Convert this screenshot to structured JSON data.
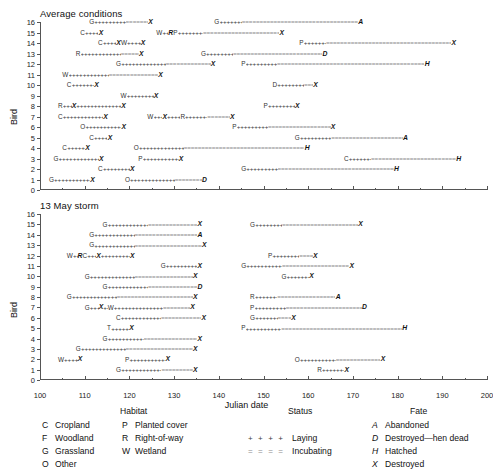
{
  "figure": {
    "xaxis_name": "Julian date",
    "yaxis_name": "Bird"
  },
  "chart_data": {
    "type": "table",
    "xlabel": "Julian date",
    "ylabel": "Bird",
    "xlim": [
      100,
      200
    ],
    "ylim": [
      0,
      16
    ],
    "xticks": [
      100,
      110,
      120,
      130,
      140,
      150,
      160,
      170,
      180,
      190,
      200
    ],
    "xminor_step": 5,
    "yticks": [
      0,
      1,
      2,
      3,
      4,
      5,
      6,
      7,
      8,
      9,
      10,
      11,
      12,
      13,
      14,
      15,
      16
    ],
    "grid": false,
    "legend_position": "below-axes",
    "panels": [
      {
        "title": "Average conditions",
        "records": [
          {
            "bird": 16,
            "habitat": "G",
            "start": 111,
            "lay_end": 118,
            "incub_end": 123,
            "fate": "X"
          },
          {
            "bird": 16,
            "habitat": "G",
            "start": 139,
            "lay_end": 144,
            "incub_end": 170,
            "fate": "A"
          },
          {
            "bird": 15,
            "habitat": "C",
            "start": 109,
            "lay_end": 112,
            "fate": "X"
          },
          {
            "bird": 15,
            "habitat": "W",
            "start": 126,
            "mid": [
              {
                "code": "R",
                "pos": 127.3,
                "type": "fate"
              }
            ],
            "habitat2": "P",
            "start2": 128.3,
            "lay_end": 134,
            "incub_end": 151,
            "fate": "X"
          },
          {
            "bird": 14,
            "habitat": "C",
            "start": 113,
            "lay_end": 115,
            "mid": [
              {
                "code": "X",
                "pos": 116,
                "type": "fate"
              }
            ],
            "habitat2": "W",
            "start2": 117,
            "lay_end2": 120,
            "fate": "X"
          },
          {
            "bird": 14,
            "habitat": "P",
            "start": 158,
            "lay_end": 163,
            "incub_end": 191,
            "fate": "X"
          },
          {
            "bird": 13,
            "habitat": "R",
            "start": 108,
            "lay_end": 117,
            "incub_end": 121,
            "fate": "X"
          },
          {
            "bird": 13,
            "habitat": "G",
            "start": 136,
            "lay_end": 142,
            "incub_end": 162,
            "fate": "D"
          },
          {
            "bird": 12,
            "habitat": "G",
            "start": 117,
            "lay_end": 127,
            "incub_end": 137,
            "fate": "X"
          },
          {
            "bird": 12,
            "habitat": "P",
            "start": 145,
            "lay_end": 152,
            "incub_end": 185,
            "fate": "H"
          },
          {
            "bird": 11,
            "habitat": "W",
            "start": 105,
            "lay_end": 114,
            "incub_end": 125,
            "fate": "X"
          },
          {
            "bird": 10,
            "habitat": "C",
            "start": 106,
            "lay_end": 111,
            "fate": "X"
          },
          {
            "bird": 10,
            "habitat": "D",
            "start": 152,
            "lay_end": 158,
            "incub_end": 160,
            "fate": "X"
          },
          {
            "bird": 9,
            "habitat": "W",
            "start": 118,
            "lay_end": 124,
            "fate": "X"
          },
          {
            "bird": 8,
            "habitat": "R",
            "start": 104,
            "mid": [
              {
                "code": "X",
                "pos": 106,
                "type": "fate"
              }
            ],
            "start2": 107,
            "lay_end": 116,
            "fate": "X"
          },
          {
            "bird": 8,
            "habitat": "P",
            "start": 150,
            "lay_end": 156,
            "fate": "X"
          },
          {
            "bird": 7,
            "habitat": "C",
            "start": 104,
            "lay_end": 113,
            "fate": "X"
          },
          {
            "bird": 7,
            "habitat": "W",
            "start": 124,
            "mid": [
              {
                "code": "X",
                "pos": 126,
                "type": "fate"
              },
              {
                "code": "R",
                "pos": 129,
                "type": "hab"
              }
            ],
            "lay_end": 134,
            "incub_end": 139,
            "fate": "X"
          },
          {
            "bird": 6,
            "habitat": "O",
            "start": 109,
            "lay_end": 117,
            "fate": "X"
          },
          {
            "bird": 6,
            "habitat": "P",
            "start": 143,
            "lay_end": 150,
            "incub_end": 164,
            "fate": "X"
          },
          {
            "bird": 5,
            "habitat": "C",
            "start": 111,
            "lay_end": 114,
            "fate": "X"
          },
          {
            "bird": 5,
            "habitat": "G",
            "start": 157,
            "lay_end": 164,
            "incub_end": 180,
            "fate": "A"
          },
          {
            "bird": 4,
            "habitat": "C",
            "start": 105,
            "lay_end": 109,
            "fate": "X"
          },
          {
            "bird": 4,
            "habitat": "O",
            "start": 121,
            "lay_end": 131,
            "incub_end": 158,
            "fate": "H"
          },
          {
            "bird": 3,
            "habitat": "G",
            "start": 103,
            "lay_end": 112,
            "fate": "X"
          },
          {
            "bird": 3,
            "habitat": "P",
            "start": 122,
            "lay_end": 130,
            "fate": "X"
          },
          {
            "bird": 3,
            "habitat": "C",
            "start": 168,
            "lay_end": 173,
            "incub_end": 192,
            "fate": "H"
          },
          {
            "bird": 2,
            "habitat": "C",
            "start": 113,
            "lay_end": 119,
            "fate": "X"
          },
          {
            "bird": 2,
            "habitat": "G",
            "start": 145,
            "lay_end": 152,
            "incub_end": 178,
            "fate": "H"
          },
          {
            "bird": 1,
            "habitat": "G",
            "start": 102,
            "lay_end": 110,
            "fate": "X"
          },
          {
            "bird": 1,
            "habitat": "O",
            "start": 119,
            "lay_end": 129,
            "incub_end": 135,
            "fate": "D"
          }
        ]
      },
      {
        "title": "13 May storm",
        "records": [
          {
            "bird": 15,
            "habitat": "G",
            "start": 114,
            "lay_end": 123,
            "incub_end": 134,
            "fate": "X"
          },
          {
            "bird": 15,
            "habitat": "G",
            "start": 147,
            "lay_end": 153,
            "incub_end": 170,
            "fate": "X"
          },
          {
            "bird": 14,
            "habitat": "G",
            "start": 111,
            "lay_end": 120,
            "incub_end": 134,
            "fate": "A"
          },
          {
            "bird": 13,
            "habitat": "G",
            "start": 111,
            "lay_end": 120,
            "incub_end": 135,
            "fate": "X"
          },
          {
            "bird": 12,
            "habitat": "W",
            "start": 106,
            "mid": [
              {
                "code": "R",
                "pos": 107,
                "type": "fate"
              }
            ],
            "habitat2": "C",
            "start2": 108,
            "lay_end": 110,
            "mid2": [
              {
                "code": "X",
                "pos": 111.5,
                "type": "fate"
              }
            ],
            "lay_end2": 118,
            "fate": "X"
          },
          {
            "bird": 12,
            "habitat": "P",
            "start": 151,
            "lay_end": 157,
            "incub_end": 160,
            "fate": "X"
          },
          {
            "bird": 11,
            "habitat": "G",
            "start": 127,
            "lay_end": 134,
            "fate": "X"
          },
          {
            "bird": 11,
            "habitat": "G",
            "start": 145,
            "lay_end": 153,
            "incub_end": 168,
            "fate": "X"
          },
          {
            "bird": 10,
            "habitat": "G",
            "start": 110,
            "lay_end": 120,
            "incub_end": 133,
            "fate": "X"
          },
          {
            "bird": 10,
            "habitat": "G",
            "start": 154,
            "lay_end": 159,
            "fate": "X"
          },
          {
            "bird": 9,
            "habitat": "G",
            "start": 114,
            "lay_end": 123,
            "incub_end": 134,
            "fate": "D"
          },
          {
            "bird": 8,
            "habitat": "G",
            "start": 106,
            "lay_end": 116,
            "incub_end": 133,
            "fate": "X"
          },
          {
            "bird": 8,
            "habitat": "R",
            "start": 147,
            "lay_end": 152,
            "incub_end": 165,
            "fate": "A"
          },
          {
            "bird": 7,
            "habitat": "G",
            "start": 110,
            "mid": [
              {
                "code": "X",
                "pos": 112,
                "type": "fate"
              },
              {
                "code": "W",
                "pos": 113,
                "type": "hab"
              }
            ],
            "lay_end": 124,
            "incub_end": 130,
            "fate": "X"
          },
          {
            "bird": 7,
            "habitat": "P",
            "start": 147,
            "lay_end": 154,
            "incub_end": 171,
            "fate": "D"
          },
          {
            "bird": 6,
            "habitat": "C",
            "start": 117,
            "lay_end": 126,
            "incub_end": 135,
            "fate": "X"
          },
          {
            "bird": 6,
            "habitat": "G",
            "start": 147,
            "lay_end": 152,
            "incub_end": 155,
            "fate": "X"
          },
          {
            "bird": 5,
            "habitat": "T",
            "start": 115,
            "lay_end": 119,
            "fate": "X"
          },
          {
            "bird": 5,
            "habitat": "P",
            "start": 145,
            "lay_end": 153,
            "incub_end": 180,
            "fate": "H"
          },
          {
            "bird": 4,
            "habitat": "G",
            "start": 114,
            "lay_end": 122,
            "incub_end": 134,
            "fate": "X"
          },
          {
            "bird": 3,
            "habitat": "G",
            "start": 108,
            "lay_end": 118,
            "incub_end": 133,
            "fate": "X"
          },
          {
            "bird": 2,
            "habitat": "W",
            "start": 104,
            "lay_end": 107,
            "fate": "X"
          },
          {
            "bird": 2,
            "habitat": "P",
            "start": 119,
            "lay_end": 127,
            "fate": "X"
          },
          {
            "bird": 2,
            "habitat": "O",
            "start": 157,
            "lay_end": 165,
            "incub_end": 175,
            "fate": "X"
          },
          {
            "bird": 1,
            "habitat": "G",
            "start": 117,
            "lay_end": 126,
            "incub_end": 133,
            "fate": "X"
          },
          {
            "bird": 1,
            "habitat": "R",
            "start": 162,
            "lay_end": 167,
            "fate": "X"
          }
        ]
      }
    ]
  },
  "legend": {
    "habitat": {
      "heading": "Habitat",
      "col1": [
        {
          "code": "C",
          "label": "Cropland"
        },
        {
          "code": "F",
          "label": "Woodland"
        },
        {
          "code": "G",
          "label": "Grassland"
        },
        {
          "code": "O",
          "label": "Other"
        }
      ],
      "col2": [
        {
          "code": "P",
          "label": "Planted cover"
        },
        {
          "code": "R",
          "label": "Right-of-way"
        },
        {
          "code": "W",
          "label": "Wetland"
        }
      ]
    },
    "status": {
      "heading": "Status",
      "rows": [
        {
          "symbol": "+ + + +",
          "label": "Laying",
          "style": "laying"
        },
        {
          "symbol": "= = = =",
          "label": "Incubating",
          "style": "incubating"
        }
      ]
    },
    "fate": {
      "heading": "Fate",
      "rows": [
        {
          "code": "A",
          "label": "Abandoned"
        },
        {
          "code": "D",
          "label": "Destroyed—hen dead"
        },
        {
          "code": "H",
          "label": "Hatched"
        },
        {
          "code": "X",
          "label": "Destroyed"
        }
      ]
    }
  }
}
